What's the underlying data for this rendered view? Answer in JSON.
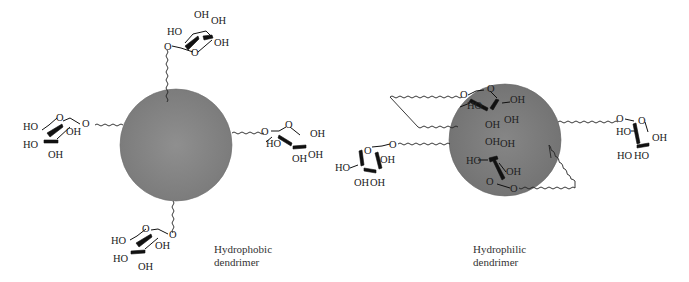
{
  "figure": {
    "panels": [
      {
        "id": "hydrophobic",
        "caption_line1": "Hydrophobic",
        "caption_line2": "dendrimer",
        "core_color": "#8a8a8a",
        "sugars": [
          {
            "position": "top",
            "labels": {
              "oh_top1": "OH",
              "oh_top2": "OH",
              "ho": "HO",
              "oh_right": "OH",
              "o_link": "O",
              "o_ring": "O"
            }
          },
          {
            "position": "left",
            "labels": {
              "ho_top": "HO",
              "oh_mid": "OH",
              "ho_bot": "HO",
              "oh_bot": "OH",
              "o_ring": "O",
              "o_link": "O"
            }
          },
          {
            "position": "right",
            "labels": {
              "o_link": "O",
              "o_ring": "O",
              "oh_right": "OH",
              "ho": "HO",
              "oh_bot1": "OH",
              "oh_bot2": "OH"
            }
          },
          {
            "position": "bottom",
            "labels": {
              "ho_top": "HO",
              "oh_mid": "OH",
              "ho_bot": "HO",
              "oh_bot": "OH",
              "o_ring": "O",
              "o_link": "O"
            }
          }
        ]
      },
      {
        "id": "hydrophilic",
        "caption_line1": "Hydrophilic",
        "caption_line2": "dendrimer",
        "core_color": "#7e7e7e",
        "sugars": [
          {
            "position": "inner-top",
            "labels": {
              "o_link": "O",
              "o_ring": "O",
              "ho": "HO",
              "oh_right": "OH",
              "oh_bot1": "OH",
              "oh_bot2": "OH"
            }
          },
          {
            "position": "inner-bottom",
            "labels": {
              "oh_top1": "OH",
              "oh_top2": "OH",
              "ho": "HO",
              "oh_right": "OH",
              "o_ring": "O",
              "o_link": "O"
            }
          },
          {
            "position": "left",
            "labels": {
              "o_ring": "O",
              "o_link": "O",
              "oh_mid": "OH",
              "ho": "HO",
              "oh_bot1": "OH",
              "oh_bot2": "OH"
            }
          },
          {
            "position": "right",
            "labels": {
              "o_link": "O",
              "o_ring": "O",
              "ho": "HO",
              "oh_right": "OH",
              "ho_bot1": "HO",
              "ho_bot2": "HO"
            }
          }
        ]
      }
    ]
  }
}
